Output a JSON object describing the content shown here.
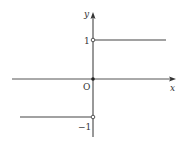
{
  "diagram": {
    "type": "piecewise-function-graph",
    "function": "sign(x)",
    "axes": {
      "x_label": "x",
      "y_label": "y",
      "origin_label": "O"
    },
    "tick_labels": {
      "y_pos_one": "1",
      "y_neg_one": "−1"
    },
    "segments": [
      {
        "name": "upper",
        "y": 1,
        "x_range": "x > 0",
        "left_endpoint": "open"
      },
      {
        "name": "lower",
        "y": -1,
        "x_range": "x < 0",
        "right_endpoint": "open"
      }
    ],
    "points": [
      {
        "name": "origin",
        "x": 0,
        "y": 0,
        "style": "filled"
      }
    ],
    "colors": {
      "axis": "#333333",
      "curve": "#444444",
      "background": "#ffffff"
    }
  }
}
